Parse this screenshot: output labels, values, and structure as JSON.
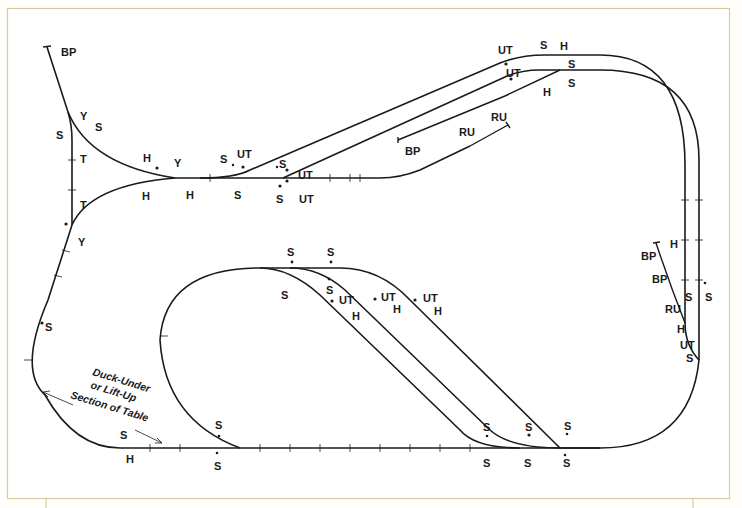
{
  "diagram": {
    "type": "model-railroad-track-plan",
    "colors": {
      "track": "#1a1a1a",
      "frame": "#d9c9a0",
      "paper": "#ffffff"
    },
    "note": {
      "lines": [
        "Duck-Under",
        "or Lift-Up",
        "Section of Table"
      ]
    },
    "labels": {
      "yard_bp": "BP",
      "yard_y1": "Y",
      "yard_s1": "S",
      "yard_s2": "S",
      "yard_t1": "T",
      "yard_t2": "T",
      "yard_y2": "Y",
      "wye_h1": "H",
      "wye_y": "Y",
      "wye_h2": "H",
      "wye_h3": "H",
      "left_s": "S",
      "jct_s1": "S",
      "jct_ut1": "UT",
      "jct_s2": "S",
      "jct_s3": "S",
      "jct_ut2": "UT",
      "jct_s4": "S",
      "jct_ut3": "UT",
      "mid_bp": "BP",
      "mid_ru1": "RU",
      "mid_ru2": "RU",
      "top_ut1": "UT",
      "top_s1": "S",
      "top_h1": "H",
      "top_ut2": "UT",
      "top_s2": "S",
      "top_h2": "H",
      "top_s3": "S",
      "right_h1": "H",
      "right_bp1": "BP",
      "right_bp2": "BP",
      "right_s1": "S",
      "right_s2": "S",
      "right_ru": "RU",
      "right_h2": "H",
      "right_ut": "UT",
      "right_s3": "S",
      "loop_s1": "S",
      "loop_s2": "S",
      "loop_s3": "S",
      "loop_s4": "S",
      "div_ut1": "UT",
      "div_h1": "H",
      "div_ut2": "UT",
      "div_h2": "H",
      "div_ut3": "UT",
      "div_h3": "H",
      "bot_s1": "S",
      "bot_h1": "H",
      "bot_s2": "S",
      "bot_s3": "S",
      "bot_s4": "S",
      "bot_s5": "S",
      "bot_s6": "S",
      "bot_s7": "S",
      "bot_s8": "S",
      "bot_s9": "S"
    },
    "legend_codes": [
      "BP",
      "Y",
      "S",
      "T",
      "H",
      "UT",
      "RU"
    ]
  }
}
